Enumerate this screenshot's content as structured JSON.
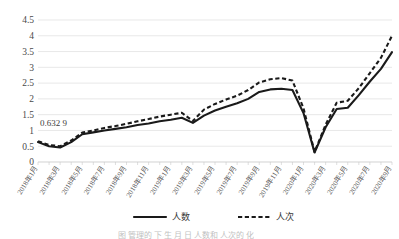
{
  "chart_data": {
    "type": "line",
    "title": "",
    "xlabel": "",
    "ylabel": "",
    "ylim": [
      0,
      4.5
    ],
    "yticks": [
      "0",
      "0.5",
      "1",
      "1.5",
      "2",
      "2.5",
      "3",
      "3.5",
      "4",
      "4.5"
    ],
    "grid": true,
    "legend_position": "bottom",
    "x": [
      "2018年1月",
      "2018年2月",
      "2018年3月",
      "2018年4月",
      "2018年5月",
      "2018年6月",
      "2018年7月",
      "2018年8月",
      "2018年9月",
      "2018年10月",
      "2018年11月",
      "2018年12月",
      "2019年1月",
      "2019年2月",
      "2019年3月",
      "2019年4月",
      "2019年5月",
      "2019年6月",
      "2019年7月",
      "2019年8月",
      "2019年9月",
      "2019年10月",
      "2019年11月",
      "2019年12月",
      "2020年1月",
      "2020年2月",
      "2020年3月",
      "2020年4月",
      "2020年5月",
      "2020年6月",
      "2020年7月",
      "2020年8月",
      "2020年9月"
    ],
    "xticklabels": [
      "2018年1月",
      "2018年3月",
      "2018年5月",
      "2018年7月",
      "2018年9月",
      "2018年11月",
      "2019年1月",
      "2019年3月",
      "2019年5月",
      "2019年7月",
      "2019年9月",
      "2019年11月",
      "2020年1月",
      "2020年3月",
      "2020年5月",
      "2020年7月",
      "2020年9月"
    ],
    "series": [
      {
        "name": "人数",
        "style": "solid",
        "values": [
          0.63,
          0.5,
          0.46,
          0.63,
          0.88,
          0.94,
          1.0,
          1.05,
          1.1,
          1.17,
          1.22,
          1.29,
          1.34,
          1.4,
          1.24,
          1.47,
          1.63,
          1.75,
          1.86,
          2.0,
          2.22,
          2.3,
          2.32,
          2.28,
          1.55,
          0.3,
          1.1,
          1.68,
          1.72,
          2.12,
          2.55,
          2.95,
          3.48
        ]
      },
      {
        "name": "人次",
        "style": "dashed",
        "values": [
          0.66,
          0.54,
          0.5,
          0.68,
          0.93,
          1.0,
          1.08,
          1.14,
          1.21,
          1.29,
          1.36,
          1.44,
          1.5,
          1.56,
          1.3,
          1.66,
          1.84,
          1.98,
          2.1,
          2.28,
          2.52,
          2.62,
          2.66,
          2.58,
          1.7,
          0.32,
          1.18,
          1.88,
          1.94,
          2.34,
          2.82,
          3.3,
          4.0
        ]
      }
    ],
    "annotations": [
      {
        "text": "0.632 9",
        "series": "人数",
        "x": "2018年1月"
      },
      {
        "text": "4,191 5",
        "series": "人次",
        "x": "2020年9月"
      }
    ]
  },
  "legend": {
    "items": [
      {
        "label": "人数",
        "style": "solid"
      },
      {
        "label": "人次",
        "style": "dashed"
      }
    ]
  },
  "caption": {
    "text": "图   管理的 下  生 月 日 人数和 人次的 化 "
  }
}
